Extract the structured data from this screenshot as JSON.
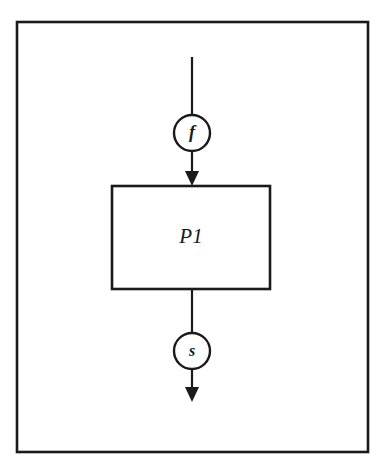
{
  "figure": {
    "kind": "block-diagram",
    "background_color": "#ffffff",
    "stroke_color": "#1a1a1a",
    "text_color": "#1a1a1a"
  },
  "frame": {
    "label": "diagram-border",
    "x": 17,
    "y": 22,
    "width": 351,
    "height": 430,
    "stroke_width": 2.6
  },
  "process": {
    "label": "P1",
    "x": 112,
    "y": 186,
    "width": 158,
    "height": 103,
    "stroke_width": 2.6,
    "font_size": 21
  },
  "signals": [
    {
      "label": "f",
      "role": "input-signal",
      "cx": 192,
      "cy": 133,
      "r": 18,
      "stroke_width": 2.4,
      "font_size": 18
    },
    {
      "label": "s",
      "role": "output-signal",
      "cx": 192,
      "cy": 351,
      "r": 18,
      "stroke_width": 2.4,
      "font_size": 16
    }
  ],
  "edges": [
    {
      "name": "input-arrow",
      "from": "diagram-top",
      "to": "P1",
      "x": 192,
      "y_start": 57,
      "y_end": 186,
      "stroke_width": 2.2,
      "arrow_at_end": true
    },
    {
      "name": "output-arrow",
      "from": "P1",
      "to": "diagram-bottom",
      "x": 192,
      "y_start": 289,
      "y_end": 402,
      "stroke_width": 2.2,
      "arrow_at_end": true
    }
  ],
  "arrow_head": {
    "half_width": 7,
    "length": 15
  }
}
